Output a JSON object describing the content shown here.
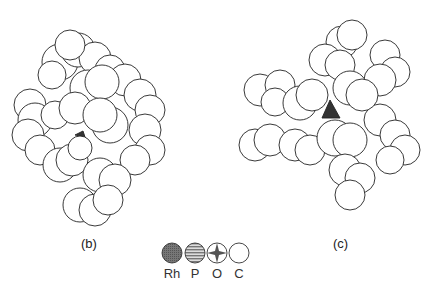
{
  "figure": {
    "panels": [
      {
        "id": "b",
        "label": "(b)"
      },
      {
        "id": "c",
        "label": "(c)"
      }
    ],
    "legend": [
      {
        "symbol": "Rh",
        "fill": "dense-hatch",
        "color": "#6e6e6e"
      },
      {
        "symbol": "P",
        "fill": "horizontal-stripes",
        "color": "#8a8a8a"
      },
      {
        "symbol": "O",
        "fill": "star-pattern",
        "color": "#555555"
      },
      {
        "symbol": "C",
        "fill": "open",
        "color": "#ffffff"
      }
    ]
  }
}
